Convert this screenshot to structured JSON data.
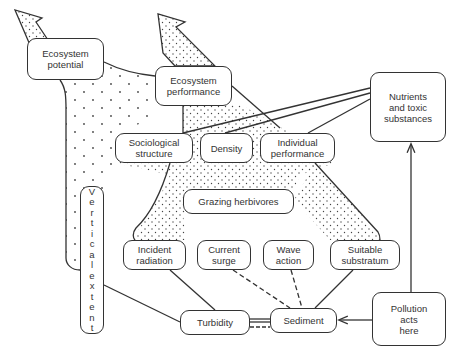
{
  "diagram": {
    "nodes": {
      "ecosystem_potential": "Ecosystem\npotential",
      "ecosystem_performance": "Ecosystem\nperformance",
      "nutrients": "Nutrients\nand toxic\nsubstances",
      "sociological_structure": "Sociological\nstructure",
      "density": "Density",
      "individual_performance": "Individual\nperformance",
      "vertical_extent": "V e r t i c a l   e x t e n t",
      "grazing_herbivores": "Grazing herbivores",
      "incident_radiation": "Incident\nradiation",
      "current_surge": "Current\nsurge",
      "wave_action": "Wave\naction",
      "suitable_substratum": "Suitable\nsubstratum",
      "turbidity": "Turbidity",
      "sediment": "Sediment",
      "pollution": "Pollution\nacts\nhere"
    },
    "vertical_letters": [
      "V",
      "e",
      "r",
      "t",
      "i",
      "c",
      "a",
      "l",
      "",
      "e",
      "x",
      "t",
      "e",
      "n",
      "t"
    ],
    "colors": {
      "stroke": "#333333",
      "background": "#ffffff",
      "dots": "#444444"
    }
  }
}
